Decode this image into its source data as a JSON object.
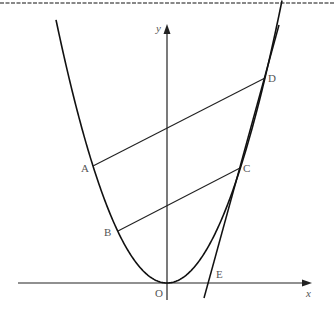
{
  "diagram": {
    "type": "parabola-with-parallel-chords-and-tangent",
    "colors": {
      "stroke": "#1a1a1a",
      "label": "#555555",
      "border": "#777777"
    },
    "axes": {
      "x_label": "x",
      "y_label": "y",
      "origin_label": "O"
    },
    "points": {
      "A": "A",
      "B": "B",
      "C": "C",
      "D": "D",
      "E": "E"
    },
    "segments": [
      "AD",
      "BC"
    ],
    "tangent": {
      "through": "C",
      "meets_x_axis_at": "E"
    }
  }
}
